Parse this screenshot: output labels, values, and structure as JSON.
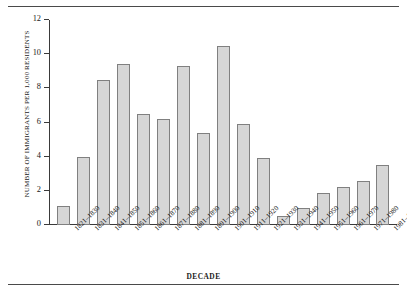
{
  "chart_data": {
    "type": "bar",
    "title": "",
    "xlabel": "DECADE",
    "ylabel": "NUMBER OF IMMIGRANTS PER 1,000 RESIDENTS",
    "ylim": [
      0,
      12
    ],
    "yticks": [
      0,
      2,
      4,
      6,
      8,
      10,
      12
    ],
    "grid": false,
    "legend": false,
    "categories": [
      "1821–1830",
      "1831–1840",
      "1841–1850",
      "1851–1860",
      "1861–1870",
      "1871–1880",
      "1881–1890",
      "1891–1900",
      "1901–1910",
      "1911–1920",
      "1921–1930",
      "1931–1940",
      "1941–1950",
      "1951–1960",
      "1961–1970",
      "1971–1980",
      "1981–1990"
    ],
    "values": [
      1.1,
      4.0,
      8.5,
      9.4,
      6.5,
      6.2,
      9.3,
      5.4,
      10.5,
      5.9,
      3.9,
      0.5,
      1.0,
      1.9,
      2.25,
      2.55,
      3.5
    ],
    "bar_color": "#d6d6d6",
    "bar_edge_color": "#808080",
    "axis_color": "#3a3a3a"
  }
}
